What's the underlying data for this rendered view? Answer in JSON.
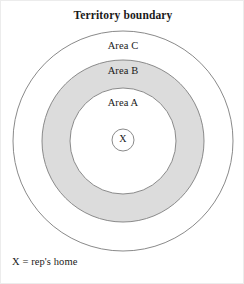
{
  "diagram": {
    "title": "Territory boundary",
    "type": "concentric-circles",
    "canvas": {
      "width": 244,
      "height": 284
    },
    "center": {
      "x": 122,
      "y": 140
    },
    "rings": [
      {
        "id": "area-c",
        "label": "Area C",
        "radius": 110,
        "fill": "#ffffff",
        "stroke": "#8a8a8a",
        "role": "outer-territory-boundary"
      },
      {
        "id": "area-b",
        "label": "Area B",
        "radius": 81,
        "fill": "#dcdcdc",
        "stroke": "#8a8a8a",
        "role": "middle-shaded-band"
      },
      {
        "id": "area-a",
        "label": "Area A",
        "radius": 53,
        "fill": "#ffffff",
        "stroke": "#8a8a8a",
        "role": "inner-core"
      }
    ],
    "marker": {
      "id": "home-marker",
      "label": "X",
      "radius": 11,
      "center": {
        "x": 122,
        "y": 139
      },
      "fill": "#ffffff",
      "stroke": "#8a8a8a"
    },
    "legend": {
      "note": "X = rep's home"
    },
    "colors": {
      "shaded_band": "#dcdcdc",
      "stroke": "#8a8a8a",
      "text": "#1a1a1a",
      "background": "#ffffff",
      "frame": "#ececec"
    }
  }
}
